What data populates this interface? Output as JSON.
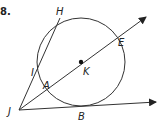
{
  "problem_number": "8.",
  "labels": {
    "H": "H",
    "E": "E",
    "I": "I",
    "K": "K",
    "A": "A",
    "J": "J",
    "B": "B"
  },
  "colors": {
    "stroke": "#333333",
    "background": "#ffffff"
  },
  "geometry": {
    "circle": {
      "center": "K",
      "cx": 81,
      "cy": 62,
      "r": 44
    },
    "rays": [
      "J->A->K->E (secant through center)",
      "J->B (tangent)"
    ],
    "segments": [
      "J->I->H (secant)"
    ]
  }
}
